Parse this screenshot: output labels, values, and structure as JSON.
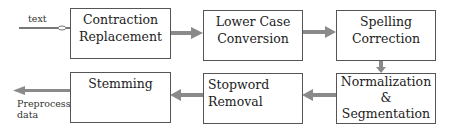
{
  "diagram": {
    "input_label": "text",
    "output_label": "Preprocessed data",
    "output_label_lines": [
      "Preprocessed",
      "data"
    ],
    "steps": [
      {
        "id": "contraction-replacement",
        "lines": [
          "Contraction",
          "Replacement"
        ]
      },
      {
        "id": "lower-case-conversion",
        "lines": [
          "Lower Case",
          "Conversion"
        ]
      },
      {
        "id": "spelling-correction",
        "lines": [
          "Spelling",
          "Correction"
        ]
      },
      {
        "id": "normalization-segmentation",
        "lines": [
          "Normalization",
          "&",
          "Segmentation"
        ]
      },
      {
        "id": "stopword-removal",
        "lines": [
          "Stopword",
          "Removal"
        ]
      },
      {
        "id": "stemming",
        "lines": [
          "Stemming"
        ]
      }
    ],
    "flow": [
      "text -> Contraction Replacement",
      "Contraction Replacement -> Lower Case Conversion",
      "Lower Case Conversion -> Spelling Correction",
      "Spelling Correction -> Normalization & Segmentation",
      "Normalization & Segmentation -> Stopword Removal",
      "Stopword Removal -> Stemming",
      "Stemming -> Preprocessed data"
    ],
    "colors": {
      "border": "#555555",
      "arrow": "#8a8a8a"
    }
  }
}
